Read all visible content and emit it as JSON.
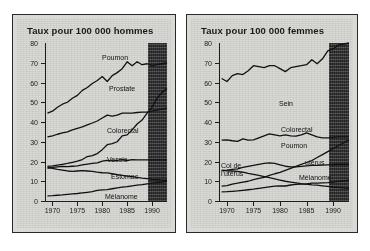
{
  "figure": {
    "background": "#ffffff",
    "panel_background": "#d9d9d6",
    "shade_color": "#3a3a3a",
    "line_color": "#111111"
  },
  "chart_data": [
    {
      "type": "line",
      "id": "hommes",
      "title": "Taux pour 100 000 hommes",
      "xlabel": "",
      "ylabel": "",
      "xlim": [
        1968.5,
        1993
      ],
      "ylim": [
        0,
        80
      ],
      "yticks": [
        0,
        10,
        20,
        30,
        40,
        50,
        60,
        70,
        80
      ],
      "xticks": [
        1970,
        1975,
        1980,
        1985,
        1990
      ],
      "grid": false,
      "legend": "inline-labels",
      "shaded_region": {
        "from": 1989.2,
        "to": 1993,
        "label": ""
      },
      "x": [
        1969,
        1970,
        1971,
        1972,
        1973,
        1974,
        1975,
        1976,
        1977,
        1978,
        1979,
        1980,
        1981,
        1982,
        1983,
        1984,
        1985,
        1986,
        1987,
        1988,
        1989,
        1990,
        1991,
        1992,
        1993
      ],
      "series": [
        {
          "name": "Poumon",
          "values": [
            44.5,
            45.5,
            47.5,
            49,
            50,
            52,
            53.5,
            56,
            57.5,
            59.5,
            61,
            63,
            60.5,
            63.5,
            65,
            67,
            70.5,
            68.5,
            70.5,
            69,
            69.5,
            68.5,
            69,
            69.5,
            70
          ]
        },
        {
          "name": "Prostate",
          "values": [
            17.5,
            17.8,
            18.2,
            18.6,
            19,
            19.6,
            20.2,
            21,
            22.5,
            23,
            24,
            26,
            28.5,
            29,
            30,
            33,
            33.5,
            36,
            39,
            41,
            44.5,
            47.5,
            52,
            55,
            57
          ]
        },
        {
          "name": "Colorectal",
          "values": [
            32.5,
            33,
            33.8,
            34.5,
            35,
            36,
            36.8,
            37.5,
            38.5,
            39.5,
            40.5,
            42,
            43.5,
            43,
            43.5,
            44.5,
            44.5,
            44.5,
            44.8,
            45,
            45,
            45.5,
            46,
            46.5,
            47
          ]
        },
        {
          "name": "Vessie",
          "values": [
            16.5,
            17,
            17.3,
            17.5,
            17.4,
            17.6,
            17.8,
            18.3,
            18.7,
            19,
            19.3,
            20.2,
            20.6,
            20.3,
            20.6,
            21,
            20.5,
            21,
            20.8,
            20.8,
            20.8,
            20.8,
            20.8,
            20.8,
            20.8
          ]
        },
        {
          "name": "Estomac",
          "values": [
            17,
            16.5,
            16,
            15.6,
            15.2,
            15,
            15.2,
            15.4,
            15.2,
            15,
            14.6,
            14.3,
            14.2,
            13.8,
            13.4,
            13,
            12.6,
            12.3,
            12,
            11.6,
            11.3,
            11,
            10.8,
            10.6,
            10.5
          ]
        },
        {
          "name": "Mélanome",
          "values": [
            2.6,
            2.7,
            2.9,
            3.1,
            3.4,
            3.6,
            3.8,
            4.1,
            4.4,
            4.7,
            5.4,
            5.6,
            5.8,
            6.2,
            6.6,
            7,
            7.3,
            7.7,
            8,
            8.3,
            8.7,
            9,
            9.3,
            9.6,
            10
          ]
        }
      ]
    },
    {
      "type": "line",
      "id": "femmes",
      "title": "Taux pour 100 000 femmes",
      "xlabel": "",
      "ylabel": "",
      "xlim": [
        1968.5,
        1993
      ],
      "ylim": [
        0,
        80
      ],
      "yticks": [
        0,
        10,
        20,
        30,
        40,
        50,
        60,
        70,
        80
      ],
      "xticks": [
        1970,
        1975,
        1980,
        1985,
        1990
      ],
      "grid": false,
      "legend": "inline-labels",
      "shaded_region": {
        "from": 1989.2,
        "to": 1993,
        "label": ""
      },
      "x": [
        1969,
        1970,
        1971,
        1972,
        1973,
        1974,
        1975,
        1976,
        1977,
        1978,
        1979,
        1980,
        1981,
        1982,
        1983,
        1984,
        1985,
        1986,
        1987,
        1988,
        1989,
        1990,
        1991,
        1992,
        1993
      ],
      "series": [
        {
          "name": "Sein",
          "values": [
            62,
            60.5,
            63.5,
            64.5,
            64,
            66,
            68.5,
            68,
            67.5,
            68.5,
            68.5,
            67,
            65.5,
            67.5,
            68,
            68.5,
            69,
            71.5,
            69.5,
            72,
            76,
            77,
            79,
            79.5,
            80
          ]
        },
        {
          "name": "Colorectal",
          "values": [
            30.8,
            31,
            30.5,
            30.2,
            31.5,
            30.8,
            31,
            32,
            33,
            34,
            33.5,
            33,
            33.5,
            33,
            32.8,
            33.5,
            34.5,
            33.5,
            32.5,
            32,
            32,
            32.2,
            32.5,
            32.5,
            32.5
          ]
        },
        {
          "name": "Poumon",
          "values": [
            7.5,
            7.8,
            8.5,
            9,
            9.6,
            10,
            10.8,
            11.5,
            12,
            13,
            13.8,
            14.5,
            15.5,
            16.5,
            17.5,
            18.5,
            19.5,
            20.5,
            22,
            23.5,
            25,
            26.5,
            28,
            29.5,
            31
          ]
        },
        {
          "name": "Col de l'utérus",
          "values": [
            15.5,
            15.3,
            15.2,
            15,
            14.6,
            14,
            13.5,
            13,
            12.4,
            11.8,
            11.2,
            10.6,
            10,
            9.6,
            9.2,
            8.8,
            8.5,
            8.2,
            8,
            7.7,
            7.4,
            7.1,
            6.9,
            6.6,
            6.4
          ]
        },
        {
          "name": "utérus",
          "values": [
            15.5,
            15.6,
            16,
            16.3,
            17,
            17.5,
            18,
            18.5,
            19,
            19.3,
            19,
            18.3,
            17.6,
            17.3,
            17.3,
            17.5,
            17.8,
            18,
            18,
            18.2,
            18.3,
            18.4,
            18.5,
            18.5,
            18.5
          ]
        },
        {
          "name": "Mélanome",
          "values": [
            4.6,
            4.7,
            4.9,
            5.1,
            5.4,
            5.7,
            6,
            6.4,
            6.8,
            7.2,
            7.5,
            7.6,
            7.6,
            8.1,
            8.4,
            8.5,
            8.6,
            9,
            9.1,
            9.2,
            9.3,
            9.6,
            9.9,
            10.2,
            10.5
          ]
        }
      ]
    }
  ],
  "series_labels": {
    "hommes": [
      {
        "text": "Poumon",
        "x": 57,
        "y": 11
      },
      {
        "text": "Prostate",
        "x": 64,
        "y": 42
      },
      {
        "text": "Colorectal",
        "x": 62,
        "y": 84
      },
      {
        "text": "Vessie",
        "x": 62,
        "y": 113
      },
      {
        "text": "Estomac",
        "x": 66,
        "y": 130
      },
      {
        "text": "Mélanome",
        "x": 60,
        "y": 150
      }
    ],
    "femmes": [
      {
        "text": "Sein",
        "x": 60,
        "y": 57
      },
      {
        "text": "Colorectal",
        "x": 62,
        "y": 83
      },
      {
        "text": "Poumon",
        "x": 62,
        "y": 99
      },
      {
        "text": "Col de",
        "x": 2,
        "y": 119
      },
      {
        "text": "l'utérus",
        "x": 2,
        "y": 127
      },
      {
        "text": "utérus",
        "x": 86,
        "y": 116
      },
      {
        "text": "Mélanome",
        "x": 80,
        "y": 131
      }
    ]
  }
}
